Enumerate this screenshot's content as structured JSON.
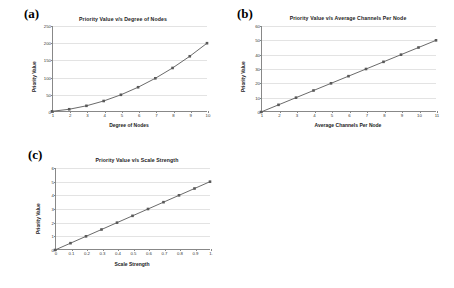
{
  "figure": {
    "background": "#ffffff",
    "series_color": "#595959",
    "grid_color": "#e3e3e3",
    "axis_color": "#888888"
  },
  "panels": [
    {
      "letter": "(a)",
      "title": "Priority Value v/s Degree of Nodes",
      "xlabel": "Degree of Nodes",
      "ylabel": "Priority Value",
      "yticks": [
        "0",
        "50",
        "100",
        "150",
        "200",
        "250"
      ],
      "xticks": [
        "1",
        "2",
        "3",
        "4",
        "5",
        "6",
        "7",
        "8",
        "9",
        "10"
      ]
    },
    {
      "letter": "(b)",
      "title": "Priority Value v/s Average Channels Per Node",
      "xlabel": "Average Channels Per Node",
      "ylabel": "Priority Value",
      "yticks": [
        "0",
        "10",
        "20",
        "30",
        "40",
        "50",
        "60"
      ],
      "xticks": [
        "1",
        "2",
        "3",
        "4",
        "5",
        "6",
        "7",
        "8",
        "9",
        "10",
        "11"
      ]
    },
    {
      "letter": "(c)",
      "title": "Priority Value  v/s Scale Strength",
      "xlabel": "Scale Strength",
      "ylabel": "Priority Value",
      "yticks": [
        "0",
        "1",
        "2",
        "3",
        "4",
        "5",
        "6"
      ],
      "xticks": [
        "0",
        "0.1",
        "0.2",
        "0.3",
        "0.4",
        "0.5",
        "0.6",
        "0.7",
        "0.8",
        "0.9",
        "1."
      ]
    }
  ],
  "chart_data": [
    {
      "type": "line",
      "panel": "(a)",
      "title": "Priority Value v/s Degree of Nodes",
      "xlabel": "Degree of Nodes",
      "ylabel": "Priority Value",
      "x": [
        1,
        2,
        3,
        4,
        5,
        6,
        7,
        8,
        9,
        10
      ],
      "values": [
        2,
        8,
        18,
        32,
        50,
        72,
        98,
        128,
        162,
        200
      ],
      "xlim": [
        1,
        10
      ],
      "ylim": [
        0,
        250
      ],
      "grid": true,
      "legend": "none",
      "marker": "square"
    },
    {
      "type": "line",
      "panel": "(b)",
      "title": "Priority Value v/s Average Channels Per Node",
      "xlabel": "Average Channels Per Node",
      "ylabel": "Priority Value",
      "x": [
        1,
        2,
        3,
        4,
        5,
        6,
        7,
        8,
        9,
        10,
        11
      ],
      "values": [
        0,
        5,
        10,
        15,
        20,
        25,
        30,
        35,
        40,
        45,
        50
      ],
      "xlim": [
        1,
        11
      ],
      "ylim": [
        0,
        60
      ],
      "grid": true,
      "legend": "none",
      "marker": "square"
    },
    {
      "type": "line",
      "panel": "(c)",
      "title": "Priority Value  v/s Scale Strength",
      "xlabel": "Scale Strength",
      "ylabel": "Priority Value",
      "x": [
        0,
        0.1,
        0.2,
        0.3,
        0.4,
        0.5,
        0.6,
        0.7,
        0.8,
        0.9,
        1.0
      ],
      "values": [
        0,
        0.5,
        1.0,
        1.5,
        2.0,
        2.5,
        3.0,
        3.5,
        4.0,
        4.5,
        5.0
      ],
      "xlim": [
        0,
        1
      ],
      "ylim": [
        0,
        6
      ],
      "grid": true,
      "legend": "none",
      "marker": "square"
    }
  ]
}
